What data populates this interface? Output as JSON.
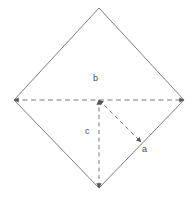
{
  "figure": {
    "title": "",
    "background_color": "#ffffff",
    "width": 196,
    "height": 204
  },
  "shape": {
    "name": "diamond",
    "description": "rotated square (rhombus) outline",
    "stroke_color": "#6e6e6e",
    "stroke_width": 0.9,
    "fill": "none",
    "vertices": {
      "top": {
        "x": 99,
        "y": 8
      },
      "right": {
        "x": 184,
        "y": 100
      },
      "bottom": {
        "x": 99,
        "y": 188
      },
      "left": {
        "x": 14,
        "y": 100
      }
    }
  },
  "center_point": {
    "x": 99,
    "y": 100
  },
  "vectors": [
    {
      "id": "b",
      "label": "b",
      "style": "dashed",
      "arrowheads": "both",
      "color": "#7a7a7a",
      "orientation": "horizontal",
      "from": {
        "x": 14,
        "y": 100
      },
      "to": {
        "x": 184,
        "y": 100
      },
      "label_position": {
        "x": 93,
        "y": 74
      }
    },
    {
      "id": "c",
      "label": "c",
      "style": "dashed",
      "arrowheads": "both",
      "color": "#7a7a7a",
      "orientation": "vertical",
      "from": {
        "x": 99,
        "y": 100
      },
      "to": {
        "x": 99,
        "y": 188
      },
      "label_position": {
        "x": 85,
        "y": 127
      }
    },
    {
      "id": "a",
      "label": "a",
      "style": "dashed",
      "arrowheads": "both",
      "color": "#7a7a7a",
      "orientation": "diagonal-down-right",
      "from": {
        "x": 99,
        "y": 100
      },
      "to": {
        "x": 141,
        "y": 142
      },
      "label_position": {
        "x": 142,
        "y": 145
      }
    }
  ],
  "labels": {
    "b": "b",
    "c": "c",
    "a": "a"
  }
}
